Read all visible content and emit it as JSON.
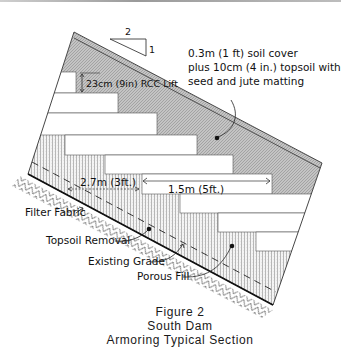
{
  "figure": {
    "caption_line1": "Figure 2",
    "caption_line2": "South Dam",
    "caption_line3": "Armoring Typical Section"
  },
  "slope_indicator": {
    "horizontal": "2",
    "vertical": "1"
  },
  "labels": {
    "soil_cover_line1": "0.3m (1 ft) soil cover",
    "soil_cover_line2": "plus 10cm (4 in.) topsoil with",
    "soil_cover_line3": "seed and jute matting",
    "rcc_lift": "23cm (9in) RCC Lift",
    "dim_filter_width": "2.7m (3ft.)",
    "dim_step_width": "1.5m (5ft.)",
    "filter_fabric": "Filter Fabric",
    "topsoil_removal": "Topsoil Removal",
    "existing_grade": "Existing Grade",
    "porous_fill": "Porous Fill"
  },
  "colors": {
    "soil_cover_fill": "#bdbdbd",
    "rcc_fill": "#ffffff",
    "porous_fill_hatch": "#8a8a8a",
    "line": "#111111"
  }
}
